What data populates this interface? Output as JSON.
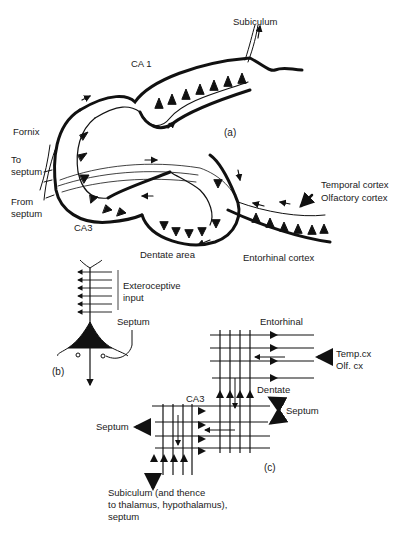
{
  "figure": {
    "panel_a": {
      "label": "(a)",
      "regions": {
        "subiculum": "Subiculum",
        "ca1": "CA 1",
        "fornix": "Fornix",
        "to_septum_1": "To",
        "to_septum_2": "septum",
        "from_septum_1": "From",
        "from_septum_2": "septum",
        "ca3": "CA3",
        "dentate_area": "Dentate area",
        "entorhinal_cortex": "Entorhinal cortex",
        "temporal_cortex": "Temporal cortex",
        "olfactory_cortex": "Olfactory cortex"
      }
    },
    "panel_b": {
      "label": "(b)",
      "exteroceptive_1": "Exteroceptive",
      "exteroceptive_2": "input",
      "septum": "Septum"
    },
    "panel_c": {
      "label": "(c)",
      "entorhinal": "Entorhinal",
      "temp_cx": "Temp.cx",
      "olf_cx": "Olf. cx",
      "dentate": "Dentate",
      "septum_right": "Septum",
      "ca3": "CA3",
      "septum_left": "Septum",
      "output_1": "Subiculum (and thence",
      "output_2": "to  thalamus, hypothalamus),",
      "output_3": "septum"
    }
  }
}
